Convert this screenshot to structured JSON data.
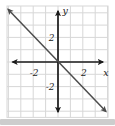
{
  "chart_data": {
    "type": "line",
    "title": "",
    "xlabel": "x",
    "ylabel": "y",
    "xlim": [
      -4,
      4
    ],
    "ylim": [
      -4.5,
      4.5
    ],
    "grid": true,
    "grid_step": 1,
    "legend": "none",
    "x_ticks_labeled": [
      {
        "value": -2,
        "label": "-2"
      },
      {
        "value": 2,
        "label": "2"
      }
    ],
    "y_ticks_labeled": [
      {
        "value": 2,
        "label": "2"
      },
      {
        "value": -2,
        "label": "-2"
      }
    ],
    "series": [
      {
        "name": "line-through-origin",
        "equation": "y = -x",
        "slope": -1,
        "y_intercept": 0,
        "points": [
          [
            -4,
            4
          ],
          [
            4,
            -4
          ]
        ],
        "arrows_both_ends": true
      }
    ],
    "axes_arrows_both_ends": true,
    "colors": {
      "background": "#ffffff",
      "plot_background": "#ffffff",
      "grid": "#d7d7d7",
      "axis": "#1b1b1b",
      "line": "#4c4c4c",
      "labels": "#1b1b1b",
      "bottom_strip": "#cdcdcd"
    }
  }
}
